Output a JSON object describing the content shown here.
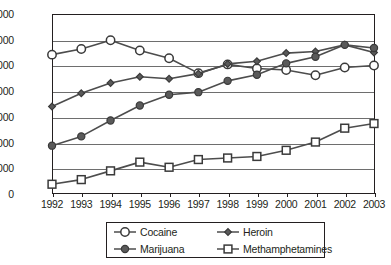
{
  "chart_data": {
    "type": "line",
    "title": "",
    "subtitle": "",
    "xlabel": "",
    "ylabel": "",
    "x": [
      "1992",
      "1993",
      "1994",
      "1995",
      "1996",
      "1997",
      "1998",
      "1999",
      "2000",
      "2001",
      "2002",
      "2003"
    ],
    "categories": [
      "1992",
      "1993",
      "1994",
      "1995",
      "1996",
      "1997",
      "1998",
      "1999",
      "2000",
      "2001",
      "2002",
      "2003"
    ],
    "ylim": [
      0,
      350000
    ],
    "yticks": [
      0,
      50000,
      100000,
      150000,
      200000,
      250000,
      300000,
      350000
    ],
    "ytick_labels": [
      "0",
      "50,000",
      "100,000",
      "150,000",
      "200,000",
      "250,000",
      "300,000",
      "350,000"
    ],
    "grid": true,
    "legend_position": "below-center",
    "series": [
      {
        "name": "Cocaine",
        "marker": "open-circle",
        "values": [
          271000,
          282000,
          299000,
          279000,
          264000,
          235000,
          252000,
          244000,
          241000,
          231000,
          246000,
          250000
        ]
      },
      {
        "name": "Heroin",
        "marker": "filled-diamond",
        "values": [
          170000,
          196000,
          216000,
          228000,
          224000,
          234000,
          253000,
          258000,
          274000,
          277000,
          290000,
          275000
        ]
      },
      {
        "name": "Marijuana",
        "marker": "filled-circle",
        "values": [
          94000,
          112000,
          143000,
          172000,
          193000,
          198000,
          220000,
          232000,
          254000,
          267000,
          290000,
          284000
        ]
      },
      {
        "name": "Methamphetamines",
        "marker": "open-square",
        "values": [
          19000,
          28000,
          45000,
          62000,
          52000,
          67000,
          70000,
          73000,
          85000,
          101000,
          128000,
          137000
        ]
      }
    ]
  },
  "legend": {
    "entries": [
      {
        "label": "Cocaine",
        "marker": "open-circle"
      },
      {
        "label": "Heroin",
        "marker": "filled-diamond"
      },
      {
        "label": "Marijuana",
        "marker": "filled-circle"
      },
      {
        "label": "Methamphetamines",
        "marker": "open-square"
      }
    ]
  },
  "colors": {
    "axis": "#231f20",
    "gridline": "#6e6e6e",
    "line": "#4d4d4d",
    "marker_fill": "#5a5a5a",
    "marker_open": "#ffffff",
    "background": "#ffffff"
  }
}
